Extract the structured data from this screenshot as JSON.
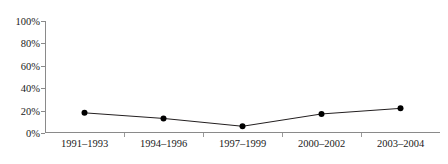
{
  "chart_data": {
    "type": "line",
    "title": "",
    "xlabel": "",
    "ylabel": "",
    "categories": [
      "1991–1993",
      "1994–1996",
      "1997–1999",
      "2000–2002",
      "2003–2004"
    ],
    "values": [
      18,
      13,
      6,
      17,
      22
    ],
    "ylim": [
      0,
      100
    ],
    "ytick_labels": [
      "100%",
      "80%",
      "60%",
      "40%",
      "20%",
      "0%"
    ],
    "ytick_values": [
      100,
      80,
      60,
      40,
      20,
      0
    ],
    "value_suffix": "%",
    "grid": false,
    "legend": "none",
    "series": [
      {
        "name": "",
        "values": [
          18,
          13,
          6,
          17,
          22
        ],
        "line_color": "#231f20",
        "marker_color": "#000000",
        "marker": "circle"
      }
    ],
    "axis_color": "#8a8a8a",
    "background": "#ffffff"
  }
}
